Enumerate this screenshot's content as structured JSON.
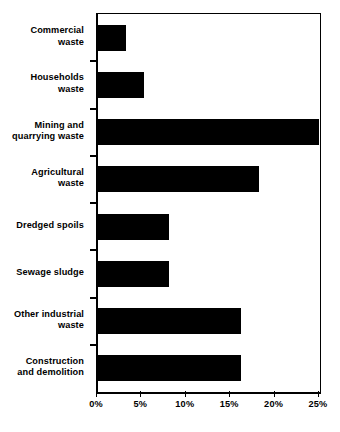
{
  "chart_data": {
    "type": "bar",
    "orientation": "horizontal",
    "title": "",
    "xlabel": "",
    "ylabel": "",
    "xlim": [
      0,
      25
    ],
    "x_tick_labels": [
      "0%",
      "5%",
      "10%",
      "15%",
      "20%",
      "25%"
    ],
    "x_tick_values": [
      0,
      5,
      10,
      15,
      20,
      25
    ],
    "grid": false,
    "legend": false,
    "bar_color": "#000000",
    "background_color": "#ffffff",
    "axis_color": "#000000",
    "categories": [
      "Commercial waste",
      "Households waste",
      "Mining and quarrying waste",
      "Agricultural waste",
      "Dredged spoils",
      "Sewage sludge",
      "Other industrial waste",
      "Construction and demolition"
    ],
    "category_label_lines": [
      [
        "Commercial",
        "waste"
      ],
      [
        "Households",
        "waste"
      ],
      [
        "Mining and",
        "quarrying waste"
      ],
      [
        "Agricultural",
        "waste"
      ],
      [
        "Dredged spoils"
      ],
      [
        "Sewage sludge"
      ],
      [
        "Other industrial",
        "waste"
      ],
      [
        "Construction",
        "and demolition"
      ]
    ],
    "values": [
      3.1,
      5.2,
      24.9,
      18.1,
      8.0,
      8.0,
      16.1,
      16.1
    ],
    "value_unit": "%"
  }
}
